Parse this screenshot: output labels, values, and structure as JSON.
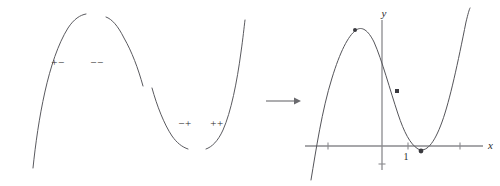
{
  "figure": {
    "colors": {
      "curve": "#5a5a5f",
      "axis": "#8a8a8e",
      "marker": "#3a3a3f",
      "arrow": "#6a6a6e",
      "background": "#ffffff",
      "text": "#2b2b2b"
    }
  },
  "left_panel": {
    "name": "concave-down-fragments",
    "sign_labels": [
      {
        "id": "first-increasing-concave-down",
        "text": "+−",
        "x": 58,
        "y": 66
      },
      {
        "id": "second-decreasing-concave-down",
        "text": "−−",
        "x": 97,
        "y": 66
      }
    ],
    "arcs": [
      {
        "id": "left-rising-arc",
        "d": "M 33,168 C 38,120 48,60 68,28 C 74,19 80,15 86,14"
      },
      {
        "id": "left-falling-arc",
        "d": "M 106,17 C 112,19 118,26 124,38 C 132,52 138,68 143,86"
      }
    ]
  },
  "middle_panel": {
    "name": "concave-up-fragments",
    "sign_labels": [
      {
        "id": "third-decreasing-concave-up",
        "text": "−+",
        "x": 185,
        "y": 127
      },
      {
        "id": "fourth-increasing-concave-up",
        "text": "++",
        "x": 217,
        "y": 127
      }
    ],
    "arcs": [
      {
        "id": "middle-falling-arc",
        "d": "M 152,88 C 157,106 164,124 172,136 C 177,143 182,147 188,149"
      },
      {
        "id": "middle-rising-arc",
        "d": "M 206,149 C 212,147 218,141 223,130 C 231,112 237,82 241,52 C 243,38 244,28 245,20"
      }
    ]
  },
  "arrow": {
    "name": "implies-arrow",
    "x1": 266,
    "x2": 300,
    "y": 101
  },
  "graph_panel": {
    "name": "cubic-graph",
    "axes": {
      "x_axis": {
        "label": "x",
        "y": 146,
        "x_start": 305,
        "x_end": 483,
        "label_x": 488,
        "label_y": 149
      },
      "y_axis": {
        "label": "y",
        "x": 382,
        "y_top": 20,
        "y_bottom": 170,
        "label_x": 384,
        "label_y": 17
      }
    },
    "ticks": [
      {
        "id": "x-tick-left-outer",
        "x": 328,
        "y": 146
      },
      {
        "id": "x-tick-one",
        "x": 408,
        "y": 146,
        "label": "1",
        "label_x": 406,
        "label_y": 160
      },
      {
        "id": "x-tick-right-outer",
        "x": 460,
        "y": 146
      },
      {
        "id": "y-tick-below-origin",
        "x": 382,
        "y": 164
      }
    ],
    "curve": {
      "id": "cubic-curve",
      "d": "M 311,180 C 316,150 322,110 332,78 C 340,52 348,36 356,30 C 362,26 368,30 374,42 C 382,60 390,90 398,114 C 404,132 410,144 418,149 C 426,153 434,144 442,122 C 450,100 458,62 466,22 C 468,14 469,10 470,8"
    },
    "markers": [
      {
        "id": "local-maximum-point",
        "shape": "dot",
        "x": 355,
        "y": 30,
        "r": 2
      },
      {
        "id": "inflection-point",
        "shape": "square",
        "x": 397,
        "y": 91,
        "size": 4
      },
      {
        "id": "local-minimum-point",
        "shape": "dot",
        "x": 421,
        "y": 151,
        "r": 2.4
      }
    ]
  }
}
